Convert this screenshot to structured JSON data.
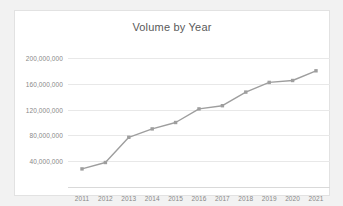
{
  "chart_data": {
    "type": "line",
    "title": "Volume by Year",
    "xlabel": "",
    "ylabel": "",
    "categories": [
      "2011",
      "2012",
      "2013",
      "2014",
      "2015",
      "2016",
      "2017",
      "2018",
      "2019",
      "2020",
      "2021"
    ],
    "series": [
      {
        "name": "Volume",
        "values": [
          28000000,
          38000000,
          77000000,
          90000000,
          100000000,
          121000000,
          126000000,
          147000000,
          162000000,
          165000000,
          180000000
        ],
        "color": "#9e9e9e",
        "marker": "square"
      }
    ],
    "ylim": [
      0,
      220000000
    ],
    "yticks": [
      40000000,
      80000000,
      120000000,
      160000000,
      200000000
    ],
    "ytick_labels": [
      "40,000,000",
      "80,000,000",
      "120,000,000",
      "160,000,000",
      "200,000,000"
    ],
    "grid": true,
    "legend": false,
    "legend_position": "none",
    "plot_background": "#ffffff",
    "grid_color": "#e8e8e8",
    "text_color": "#888888",
    "title_color": "#5a5a5a"
  }
}
